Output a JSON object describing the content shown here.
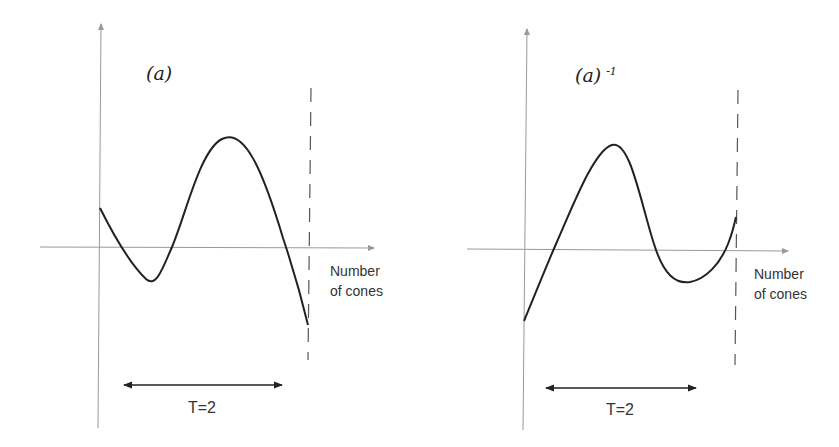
{
  "panels": [
    {
      "id": "left",
      "title": "(a)",
      "title_superscript": "",
      "x_axis_label_line1": "Number",
      "x_axis_label_line2": "of cones",
      "period_label": "T=2"
    },
    {
      "id": "right",
      "title": "(a)",
      "title_superscript": "-1",
      "x_axis_label_line1": "Number",
      "x_axis_label_line2": "of cones",
      "period_label": "T=2"
    }
  ],
  "colors": {
    "axis": "#999999",
    "curve": "#222222",
    "dashed": "#555555",
    "arrow": "#222222"
  }
}
